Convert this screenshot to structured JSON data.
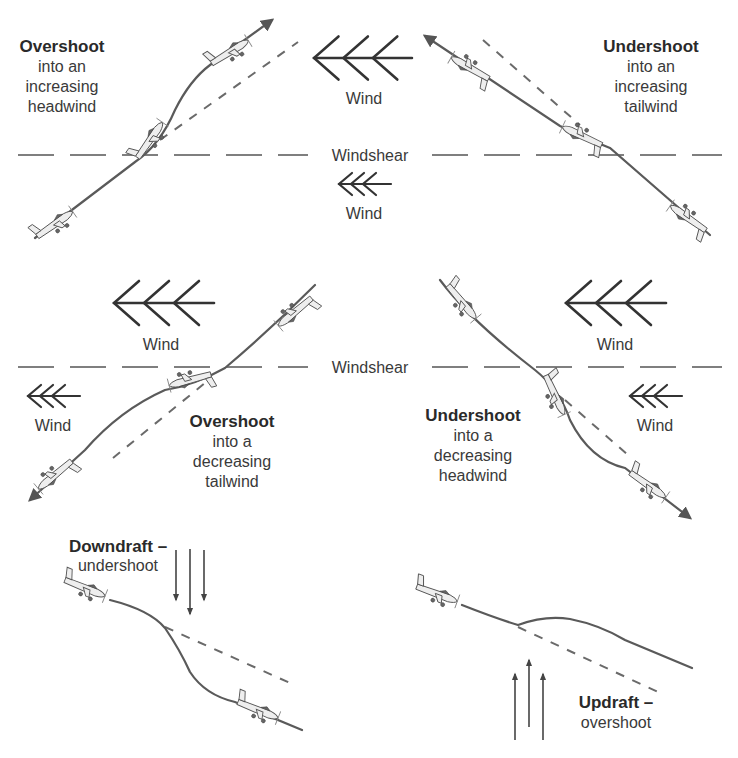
{
  "figure": {
    "colors": {
      "background": "#ffffff",
      "line": "#5a5a5a",
      "text": "#333333"
    }
  },
  "panels": {
    "overshoot_headwind": {
      "title": "Overshoot",
      "lines": [
        "into an",
        "increasing",
        "headwind"
      ]
    },
    "undershoot_tailwind": {
      "title": "Undershoot",
      "lines": [
        "into an",
        "increasing",
        "tailwind"
      ]
    },
    "overshoot_tailwind": {
      "title": "Overshoot",
      "lines": [
        "into a",
        "decreasing",
        "tailwind"
      ]
    },
    "undershoot_headwind": {
      "title": "Undershoot",
      "lines": [
        "into a",
        "decreasing",
        "headwind"
      ]
    },
    "downdraft": {
      "title": "Downdraft –",
      "lines": [
        "undershoot"
      ]
    },
    "updraft": {
      "title": "Updraft –",
      "lines": [
        "overshoot"
      ]
    }
  },
  "labels": {
    "wind": "Wind",
    "windshear": "Windshear"
  },
  "icons": {
    "airplane": "airplane-icon",
    "wind_arrow": "wind-chevron-arrow-icon",
    "draft_arrow": "vertical-arrow-icon"
  }
}
